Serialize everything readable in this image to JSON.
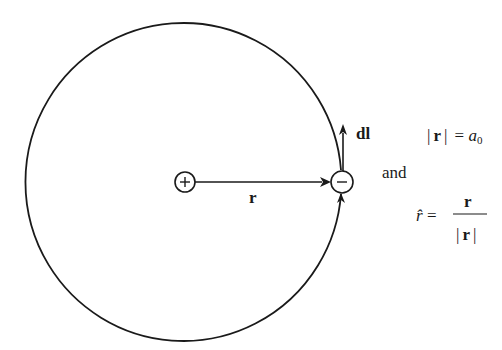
{
  "diagram": {
    "type": "bohr-hydrogen-atom-orbit",
    "colors": {
      "stroke": "#1a1a1a",
      "background": "#ffffff"
    },
    "orbit": {
      "center": [
        184,
        181
      ],
      "radius_x": 158,
      "radius_y": 159
    },
    "nucleus": {
      "label": "+",
      "center": [
        185,
        182
      ],
      "radius": 10
    },
    "electron": {
      "label": "−",
      "center": [
        342,
        182
      ],
      "radius": 11
    },
    "vectors": {
      "r": {
        "label": "r",
        "from": "nucleus",
        "to": "electron"
      },
      "dl": {
        "label": "dl",
        "direction": "up",
        "tangent_to": "orbit"
      }
    },
    "equations": {
      "eq1": {
        "lhs_bar_left": "|",
        "lhs_var": "r",
        "lhs_bar_right": "|",
        "equals": "=",
        "rhs_var": "a",
        "rhs_sub": "0"
      },
      "connector": "and",
      "eq2": {
        "lhs": "r̂",
        "equals": "=",
        "numerator": "r",
        "den_bar_left": "|",
        "den_var": "r",
        "den_bar_right": "|"
      }
    }
  }
}
